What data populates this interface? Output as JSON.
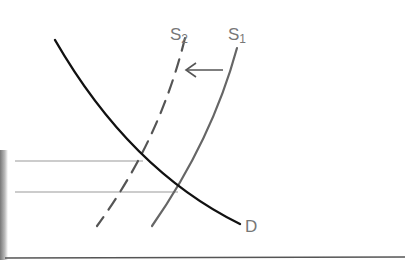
{
  "diagram": {
    "type": "supply-demand",
    "title": "",
    "curves": [
      {
        "id": "D",
        "label": "D",
        "style": "solid",
        "color": "#111111"
      },
      {
        "id": "S1",
        "label": "S",
        "subscript": "1",
        "style": "solid",
        "color": "#666666"
      },
      {
        "id": "S2",
        "label": "S",
        "subscript": "2",
        "style": "dashed",
        "color": "#555555"
      }
    ],
    "shift_arrow": {
      "from": "S1",
      "to": "S2",
      "direction": "left"
    },
    "equilibria": [
      {
        "between": [
          "D",
          "S2"
        ],
        "price_level": "higher"
      },
      {
        "between": [
          "D",
          "S1"
        ],
        "price_level": "lower"
      }
    ],
    "colors": {
      "demand": "#111111",
      "supply": "#666666",
      "guides": "#999999",
      "axis": "#555555",
      "labels": "#777777"
    }
  },
  "labels": {
    "s2_main": "S",
    "s2_sub": "2",
    "s1_main": "S",
    "s1_sub": "1",
    "d": "D"
  }
}
